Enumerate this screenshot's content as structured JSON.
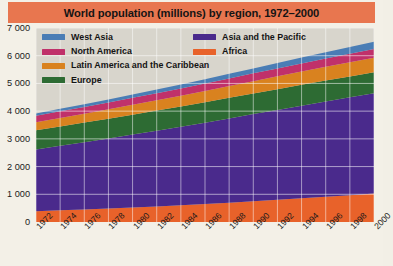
{
  "chart_data": {
    "type": "area",
    "stacked": true,
    "title": "World population (millions) by region, 1972–2000",
    "xlabel": "",
    "ylabel": "",
    "ylim": [
      0,
      7000
    ],
    "ytick_values": [
      0,
      1000,
      2000,
      3000,
      4000,
      5000,
      6000,
      7000
    ],
    "ytick_labels": [
      "0",
      "1 000",
      "2 000",
      "3 000",
      "4 000",
      "5 000",
      "6 000",
      "7 000"
    ],
    "grid": true,
    "grid_color": "#ffffff",
    "plot_background": "#d8d5cc",
    "legend_position": "top-left inside",
    "x": [
      1972,
      1974,
      1976,
      1978,
      1980,
      1982,
      1984,
      1986,
      1988,
      1990,
      1992,
      1994,
      1996,
      1998,
      2000
    ],
    "xtick_labels": [
      "1972",
      "1974",
      "1976",
      "1978",
      "1980",
      "1982",
      "1984",
      "1986",
      "1988",
      "1990",
      "1992",
      "1994",
      "1996",
      "1998",
      "2000"
    ],
    "stack_order_bottom_to_top": [
      "Africa",
      "Asia and the Pacific",
      "Europe",
      "Latin America and the Caribbean",
      "North America",
      "West Asia"
    ],
    "series": [
      {
        "name": "Africa",
        "color": "#e8622a",
        "values": [
          390,
          420,
          452,
          486,
          523,
          563,
          605,
          650,
          698,
          748,
          800,
          854,
          910,
          968,
          1030
        ]
      },
      {
        "name": "Asia and the Pacific",
        "color": "#4a2a8c",
        "values": [
          2230,
          2330,
          2430,
          2530,
          2630,
          2730,
          2830,
          2935,
          3040,
          3145,
          3245,
          3345,
          3440,
          3530,
          3620
        ]
      },
      {
        "name": "Europe",
        "color": "#2d6b33",
        "values": [
          690,
          698,
          706,
          713,
          720,
          726,
          732,
          737,
          742,
          746,
          749,
          751,
          752,
          753,
          754
        ]
      },
      {
        "name": "Latin America and the Caribbean",
        "color": "#d9821f",
        "values": [
          290,
          306,
          322,
          338,
          355,
          372,
          390,
          408,
          426,
          444,
          462,
          479,
          496,
          512,
          527
        ]
      },
      {
        "name": "North America",
        "color": "#c0316a",
        "values": [
          233,
          238,
          242,
          247,
          252,
          257,
          262,
          268,
          274,
          280,
          287,
          294,
          301,
          308,
          315
        ]
      },
      {
        "name": "West Asia",
        "color": "#4a7db5",
        "values": [
          82,
          90,
          99,
          108,
          118,
          129,
          141,
          153,
          166,
          180,
          194,
          209,
          224,
          240,
          256
        ]
      }
    ],
    "totals": [
      3915,
      4082,
      4251,
      4422,
      4598,
      4777,
      4960,
      5151,
      5346,
      5543,
      5737,
      5932,
      6123,
      6311,
      6502
    ]
  },
  "legend": {
    "items_left": [
      {
        "label": "West Asia",
        "color": "#4a7db5"
      },
      {
        "label": "North America",
        "color": "#c0316a"
      },
      {
        "label": "Latin America and the Caribbean",
        "color": "#d9821f"
      },
      {
        "label": "Europe",
        "color": "#2d6b33"
      }
    ],
    "items_right": [
      {
        "label": "Asia and the Pacific",
        "color": "#4a2a8c"
      },
      {
        "label": "Africa",
        "color": "#e8622a"
      }
    ]
  },
  "colors": {
    "title_bar": "#e8764f",
    "page_background": "#f3f0e7",
    "plot_background": "#d8d5cc",
    "gridline": "#ffffff",
    "text": "#141414"
  }
}
